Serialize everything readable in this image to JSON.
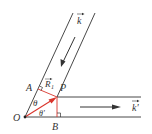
{
  "diagram": {
    "labels": {
      "k": "k",
      "k_prime": "k'",
      "A": "A",
      "B": "B",
      "O": "O",
      "P": "P",
      "R1": "R",
      "R1_sub": "1",
      "theta": "θ",
      "theta_prime": "θ'"
    },
    "colors": {
      "lines": "#333333",
      "vector": "#d9342b"
    }
  }
}
